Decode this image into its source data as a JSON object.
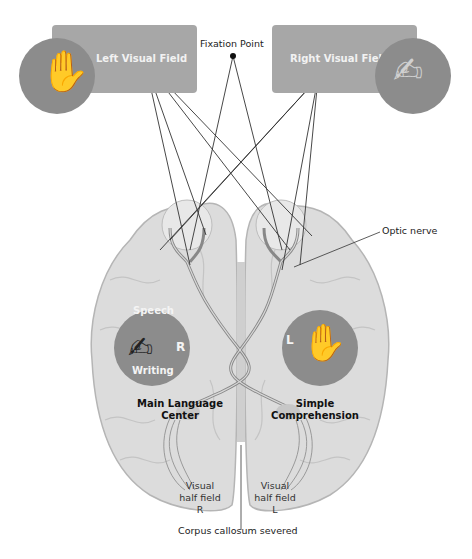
{
  "diagram": {
    "top": {
      "left_field_label": "Left Visual Field",
      "right_field_label": "Right Visual Field",
      "fixation_label": "Fixation Point"
    },
    "brain": {
      "optic_nerve_label": "Optic nerve",
      "left_hemisphere": {
        "circle_top_label": "Speech",
        "circle_bottom_label": "Writing",
        "circle_letter": "R",
        "center_label_line1": "Main Language",
        "center_label_line2": "Center",
        "visual_line1": "Visual",
        "visual_line2": "half field",
        "visual_line3": "R"
      },
      "right_hemisphere": {
        "circle_letter": "L",
        "center_label_line1": "Simple",
        "center_label_line2": "Comprehension",
        "visual_line1": "Visual",
        "visual_line2": "half field",
        "visual_line3": "L"
      },
      "corpus_label": "Corpus callosum severed"
    },
    "colors": {
      "box": "#a7a7a7",
      "circle": "#8c8c8c",
      "brain": "#dcdcdc",
      "brain_edge": "#b5b5b5",
      "line": "#333333"
    }
  }
}
